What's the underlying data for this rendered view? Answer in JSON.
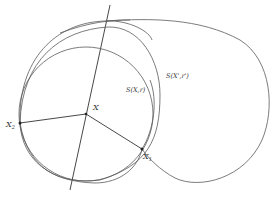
{
  "figure": {
    "labels": {
      "center": "X",
      "point_1": "X",
      "point_1_sub": "1",
      "point_2": "X",
      "point_2_sub": "2",
      "sphere_small": "S(X,r)",
      "sphere_large": "S(X',r')"
    },
    "colors": {
      "curve": "#5a5a5a",
      "segment": "#333333",
      "background": "#ffffff"
    }
  }
}
